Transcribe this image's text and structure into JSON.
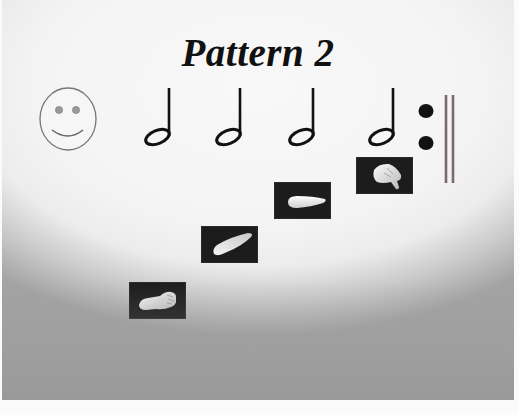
{
  "slide": {
    "title": "Pattern 2",
    "background": {
      "top_color": "#f8f8f8",
      "bottom_color": "#9c9c9c"
    },
    "face_icon": "smiley-face-icon",
    "notes": [
      {
        "type": "half-note",
        "position": 1
      },
      {
        "type": "half-note",
        "position": 2
      },
      {
        "type": "half-note",
        "position": 3
      },
      {
        "type": "half-note",
        "position": 4
      }
    ],
    "end_symbol": "repeat-sign",
    "repeat_bar_color": "#7a6a6a",
    "hand_signs": [
      {
        "icon": "hand-fist-low-icon",
        "step": 1
      },
      {
        "icon": "hand-flat-rising-icon",
        "step": 2
      },
      {
        "icon": "hand-flat-level-icon",
        "step": 3
      },
      {
        "icon": "hand-thumb-down-icon",
        "step": 4
      }
    ]
  }
}
